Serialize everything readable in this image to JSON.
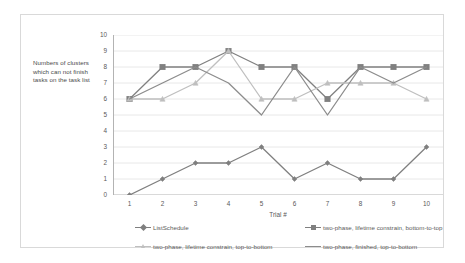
{
  "chart_data": {
    "type": "line",
    "title": "",
    "xlabel": "Trial #",
    "ylabel": "Numbers of clusters which can not finish tasks on the task list",
    "categories": [
      "1",
      "2",
      "3",
      "4",
      "5",
      "6",
      "7",
      "8",
      "9",
      "10"
    ],
    "x": [
      1,
      2,
      3,
      4,
      5,
      6,
      7,
      8,
      9,
      10
    ],
    "ylim": [
      0,
      10
    ],
    "yticks": [
      "0",
      "1",
      "2",
      "3",
      "4",
      "5",
      "6",
      "7",
      "8",
      "9",
      "10"
    ],
    "grid": true,
    "legend_position": "bottom",
    "series": [
      {
        "name": "ListSchedule",
        "color": "#7f7f7f",
        "marker": "diamond",
        "values": [
          0,
          1,
          2,
          2,
          3,
          1,
          2,
          1,
          1,
          3
        ]
      },
      {
        "name": "two-phase, lifetime constrain, bottom-to-top",
        "color": "#808080",
        "marker": "square",
        "values": [
          6,
          8,
          8,
          9,
          8,
          8,
          6,
          8,
          8,
          8
        ]
      },
      {
        "name": "two-phase, lifetime constrain, top-to-bottom",
        "color": "#bfbfbf",
        "marker": "triangle",
        "values": [
          6,
          6,
          7,
          9,
          6,
          6,
          7,
          7,
          7,
          6
        ]
      },
      {
        "name": "two-phase, finished, top-to-bottom",
        "color": "#8c8c8c",
        "marker": "none",
        "values": [
          6,
          7,
          8,
          7,
          5,
          8,
          5,
          8,
          7,
          8
        ]
      }
    ]
  },
  "axes": {
    "y_title": "Numbers of clusters which can not finish tasks on the task list",
    "x_title": "Trial #"
  },
  "colors": {
    "frame_border": "#d9d9d9",
    "gridline": "#e8e8e8",
    "axis_line": "#b3b3b3",
    "tick_text": "#595959",
    "background": "#ffffff"
  }
}
